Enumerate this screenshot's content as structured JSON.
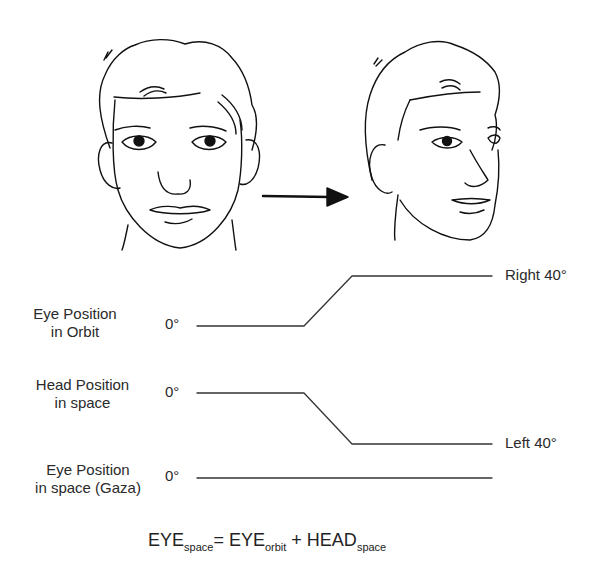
{
  "figure": {
    "illustrations": [
      {
        "name": "face-front",
        "description": "Line drawing of face looking straight ahead"
      },
      {
        "name": "face-turned",
        "description": "Line drawing of face with head turned"
      }
    ],
    "arrow": "right-arrow"
  },
  "traces": [
    {
      "label_line1": "Eye Position",
      "label_line2": "in Orbit",
      "start_label": "0°",
      "end_label": "Right 40°",
      "start_deg": 0,
      "end_deg": 40,
      "direction": "up"
    },
    {
      "label_line1": "Head Position",
      "label_line2": "in space",
      "start_label": "0°",
      "end_label": "Left 40°",
      "start_deg": 0,
      "end_deg": -40,
      "direction": "down"
    },
    {
      "label_line1": "Eye Position",
      "label_line2": "in space (Gaza)",
      "start_label": "0°",
      "end_label": "",
      "start_deg": 0,
      "end_deg": 0,
      "direction": "flat"
    }
  ],
  "formula": {
    "lhs": "EYE",
    "lhs_sub": "space",
    "eq": "= ",
    "t1": "EYE",
    "t1_sub": "orbit",
    "plus": " + ",
    "t2": "HEAD",
    "t2_sub": "space"
  }
}
